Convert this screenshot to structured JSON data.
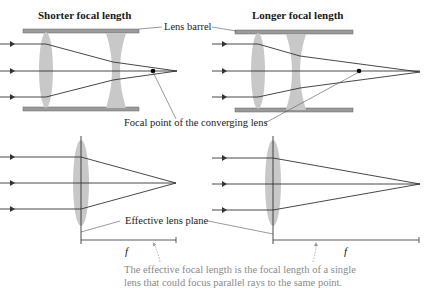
{
  "panels": {
    "top_left": {
      "title": "Shorter focal length"
    },
    "top_right": {
      "title": "Longer focal length"
    }
  },
  "labels": {
    "lens_barrel": "Lens barrel",
    "focal_point": "Focal point of the converging lens",
    "effective_plane": "Effective lens plane",
    "f_left": "f",
    "f_right": "f"
  },
  "note": {
    "line1": "The effective focal length is the focal length of a single",
    "line2": "lens that could focus parallel rays to the same point."
  },
  "colors": {
    "lens": "#c8c8c8",
    "barrel": "#8c8c8c",
    "ray": "#333333",
    "note_text": "#8a8a8a"
  }
}
